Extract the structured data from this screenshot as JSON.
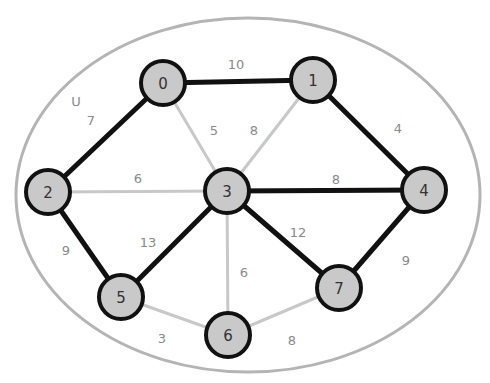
{
  "diagram": {
    "type": "weighted-graph-minimum-spanning-tree",
    "colors": {
      "background": "#ffffff",
      "outline": "#b4b4b4",
      "tree_edge": "#111111",
      "non_tree_edge": "#c8c8c8",
      "node_fill": "#c9c9c9",
      "node_stroke": "#111111",
      "node_text": "#333333",
      "weight_text": "#8a8a8a"
    },
    "outline_label": "U",
    "nodes": [
      {
        "id": "0",
        "label": "0",
        "x": 163,
        "y": 83
      },
      {
        "id": "1",
        "label": "1",
        "x": 313,
        "y": 80
      },
      {
        "id": "2",
        "label": "2",
        "x": 48,
        "y": 192
      },
      {
        "id": "3",
        "label": "3",
        "x": 227,
        "y": 191
      },
      {
        "id": "4",
        "label": "4",
        "x": 424,
        "y": 190
      },
      {
        "id": "5",
        "label": "5",
        "x": 121,
        "y": 297
      },
      {
        "id": "6",
        "label": "6",
        "x": 228,
        "y": 335
      },
      {
        "id": "7",
        "label": "7",
        "x": 339,
        "y": 288
      }
    ],
    "edges": [
      {
        "from": "0",
        "to": "1",
        "weight": "10",
        "in_tree": true,
        "lx": 236,
        "ly": 64
      },
      {
        "from": "0",
        "to": "2",
        "weight": "7",
        "in_tree": true,
        "lx": 91,
        "ly": 120
      },
      {
        "from": "0",
        "to": "3",
        "weight": "5",
        "in_tree": false,
        "lx": 214,
        "ly": 130
      },
      {
        "from": "1",
        "to": "3",
        "weight": "8",
        "in_tree": false,
        "lx": 254,
        "ly": 130
      },
      {
        "from": "1",
        "to": "4",
        "weight": "4",
        "in_tree": true,
        "lx": 398,
        "ly": 128
      },
      {
        "from": "2",
        "to": "3",
        "weight": "6",
        "in_tree": false,
        "lx": 138,
        "ly": 178
      },
      {
        "from": "3",
        "to": "4",
        "weight": "8",
        "in_tree": true,
        "lx": 336,
        "ly": 179
      },
      {
        "from": "2",
        "to": "5",
        "weight": "9",
        "in_tree": true,
        "lx": 66,
        "ly": 250
      },
      {
        "from": "3",
        "to": "5",
        "weight": "13",
        "in_tree": true,
        "lx": 148,
        "ly": 242
      },
      {
        "from": "3",
        "to": "6",
        "weight": "6",
        "in_tree": false,
        "lx": 244,
        "ly": 272
      },
      {
        "from": "3",
        "to": "7",
        "weight": "12",
        "in_tree": true,
        "lx": 298,
        "ly": 232
      },
      {
        "from": "4",
        "to": "7",
        "weight": "9",
        "in_tree": true,
        "lx": 406,
        "ly": 260
      },
      {
        "from": "5",
        "to": "6",
        "weight": "3",
        "in_tree": false,
        "lx": 162,
        "ly": 338
      },
      {
        "from": "6",
        "to": "7",
        "weight": "8",
        "in_tree": false,
        "lx": 292,
        "ly": 340
      }
    ]
  }
}
